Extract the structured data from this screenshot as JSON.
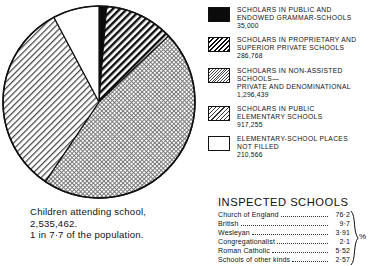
{
  "chart_data": {
    "type": "pie",
    "title": "Children attending school",
    "unit": "scholars",
    "total": 2746028,
    "categories": [
      "Scholars in public and endowed grammar-schools",
      "Scholars in proprietary and superior private schools",
      "Scholars in non-assisted schools—private and denominational",
      "Scholars in public elementary schools",
      "Elementary-school places not filled"
    ],
    "values": [
      35000,
      286768,
      1296439,
      917255,
      210566
    ],
    "fills": [
      "solid-black",
      "bold-diagonal-hatch",
      "fine-crosshatch-dots",
      "diagonal-hatch",
      "white"
    ],
    "legend_position": "right",
    "grid": false,
    "start_angle_deg": 0,
    "direction": "clockwise",
    "slice_angles_deg": [
      4.6,
      37.6,
      170.0,
      120.3,
      27.6
    ],
    "annotations": [
      "Children attending school, 2,535,462.",
      "1 in 7·7 of the population."
    ]
  },
  "pie": {
    "cx": 99,
    "cy": 102,
    "r": 96,
    "slices": [
      {
        "name": "public-and-endowed-grammar-schools",
        "fill": "solid-black",
        "start": 0.0,
        "end": 4.6
      },
      {
        "name": "proprietary-and-superior-private-schools",
        "fill": "bold-diagonal-hatch",
        "start": 4.6,
        "end": 46.5
      },
      {
        "name": "non-assisted-private-and-denominational",
        "fill": "fine-crosshatch-dots",
        "start": 46.5,
        "end": 214.0
      },
      {
        "name": "public-elementary-schools",
        "fill": "diagonal-hatch",
        "start": 214.0,
        "end": 332.0
      },
      {
        "name": "elementary-school-places-not-filled",
        "fill": "white",
        "start": 332.0,
        "end": 360.0
      }
    ]
  },
  "caption": {
    "line1": "Children attending school,",
    "line2": "2,535,462.",
    "line3": "1 in 7·7 of the population."
  },
  "legend": {
    "items": [
      {
        "swatch": "solid-black",
        "lines": [
          "SCHOLARS IN PUBLIC AND",
          "ENDOWED GRAMMAR-SCHOOLS"
        ],
        "value": "35,000"
      },
      {
        "swatch": "bold-diagonal-hatch",
        "lines": [
          "SCHOLARS IN PROPRIETARY AND",
          "SUPERIOR PRIVATE SCHOOLS"
        ],
        "value": "286,768"
      },
      {
        "swatch": "fine-crosshatch-dots",
        "lines": [
          "SCHOLARS IN NON-ASSISTED",
          "SCHOOLS—",
          "PRIVATE AND DENOMINATIONAL"
        ],
        "value": "1,296,439"
      },
      {
        "swatch": "diagonal-hatch",
        "lines": [
          "SCHOLARS IN PUBLIC",
          "ELEMENTARY SCHOOLS"
        ],
        "value": "917,255"
      },
      {
        "swatch": "white",
        "lines": [
          "ELEMENTARY-SCHOOL PLACES",
          "NOT FILLED"
        ],
        "value": "210,566"
      }
    ]
  },
  "inspected": {
    "title": "INSPECTED SCHOOLS",
    "unit_symbol": "%",
    "rows": [
      {
        "label": "Church of England",
        "value": "76·2"
      },
      {
        "label": "British",
        "value": "9·7"
      },
      {
        "label": "Wesleyan",
        "value": "3·91"
      },
      {
        "label": "Congregationalist",
        "value": "2·1"
      },
      {
        "label": "Roman Catholic",
        "value": "5·52"
      },
      {
        "label": "Schools of other kinds",
        "value": "2·57"
      }
    ]
  }
}
